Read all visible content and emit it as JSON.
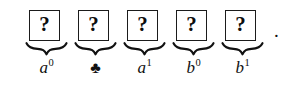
{
  "figure": {
    "kind": "math-expression",
    "background_color": "#ffffff",
    "ink_color": "#111111",
    "trailing_punctuation": ".",
    "slot_symbol": "?",
    "slots": [
      {
        "index": 0,
        "box_glyph": "?",
        "label_kind": "power",
        "label_base": "a",
        "label_sup": "0",
        "label_plain": "a0",
        "left": 25
      },
      {
        "index": 1,
        "box_glyph": "?",
        "label_kind": "symbol",
        "label_base": "♣",
        "label_sup": "",
        "label_plain": "♣",
        "left": 74
      },
      {
        "index": 2,
        "box_glyph": "?",
        "label_kind": "power",
        "label_base": "a",
        "label_sup": "1",
        "label_plain": "a1",
        "left": 123
      },
      {
        "index": 3,
        "box_glyph": "?",
        "label_kind": "power",
        "label_base": "b",
        "label_sup": "0",
        "label_plain": "b0",
        "left": 172
      },
      {
        "index": 4,
        "box_glyph": "?",
        "label_kind": "power",
        "label_base": "b",
        "label_sup": "1",
        "label_plain": "b1",
        "left": 221
      }
    ]
  }
}
